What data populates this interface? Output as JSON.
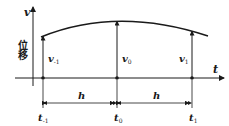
{
  "diagram": {
    "y_axis": {
      "label": "v",
      "side_label": "位移"
    },
    "x_axis": {
      "label": "t"
    },
    "points": [
      {
        "id": "prev",
        "value_label": "v",
        "value_sub": "-1",
        "time_label": "t",
        "time_sub": "-1"
      },
      {
        "id": "zero",
        "value_label": "v",
        "value_sub": "0",
        "time_label": "t",
        "time_sub": "0"
      },
      {
        "id": "next",
        "value_label": "v",
        "value_sub": "1",
        "time_label": "t",
        "time_sub": "1"
      }
    ],
    "intervals": [
      {
        "label": "h"
      },
      {
        "label": "h"
      }
    ],
    "colors": {
      "line": "#1a1a1a",
      "background": "#ffffff"
    }
  }
}
